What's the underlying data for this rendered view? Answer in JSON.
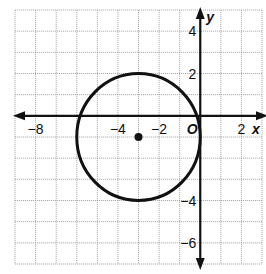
{
  "figure": {
    "x_axis_label": "x",
    "y_axis_label": "y",
    "origin_label": "O",
    "x_tick_labels": [
      {
        "value": -8,
        "text": "−8"
      },
      {
        "value": -4,
        "text": "−4"
      },
      {
        "value": -2,
        "text": "−2"
      },
      {
        "value": 2,
        "text": "2"
      }
    ],
    "y_tick_labels": [
      {
        "value": 4,
        "text": "4"
      },
      {
        "value": 2,
        "text": "2"
      },
      {
        "value": -4,
        "text": "−4"
      },
      {
        "value": -6,
        "text": "−6"
      }
    ],
    "grid": {
      "x_min": -9,
      "x_max": 3,
      "y_min": -7,
      "y_max": 5,
      "step": 1
    },
    "circle": {
      "center_x": -3,
      "center_y": -1,
      "radius": 3
    },
    "center_point": {
      "x": -3,
      "y": -1
    },
    "colors": {
      "ink": "#111111",
      "grid": "#9a9a9a",
      "background": "#ffffff"
    }
  }
}
